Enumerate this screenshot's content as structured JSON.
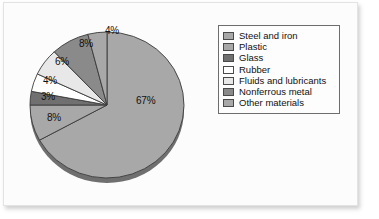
{
  "chart_data": {
    "type": "pie",
    "title": "",
    "categories": [
      "Steel and iron",
      "Plastic",
      "Glass",
      "Rubber",
      "Fluids and lubricants",
      "Nonferrous metal",
      "Other materials"
    ],
    "values": [
      67,
      8,
      3,
      4,
      6,
      8,
      4
    ],
    "value_labels": [
      "67%",
      "8%",
      "3%",
      "4%",
      "6%",
      "8%",
      "4%"
    ],
    "units": "%",
    "colors": [
      "#a8a8a8",
      "#a8a8a8",
      "#707070",
      "#ffffff",
      "#e8e8e8",
      "#8a8a8a",
      "#a8a8a8"
    ],
    "legend_position": "right",
    "start_angle_deg": 0,
    "direction": "clockwise",
    "three_d": true,
    "grid": false
  },
  "legend": {
    "items": [
      {
        "label": "Steel and iron",
        "color": "#a8a8a8"
      },
      {
        "label": "Plastic",
        "color": "#a8a8a8"
      },
      {
        "label": "Glass",
        "color": "#707070"
      },
      {
        "label": "Rubber",
        "color": "#ffffff"
      },
      {
        "label": "Fluids and lubricants",
        "color": "#e8e8e8"
      },
      {
        "label": "Nonferrous metal",
        "color": "#8a8a8a"
      },
      {
        "label": "Other materials",
        "color": "#a8a8a8"
      }
    ]
  }
}
